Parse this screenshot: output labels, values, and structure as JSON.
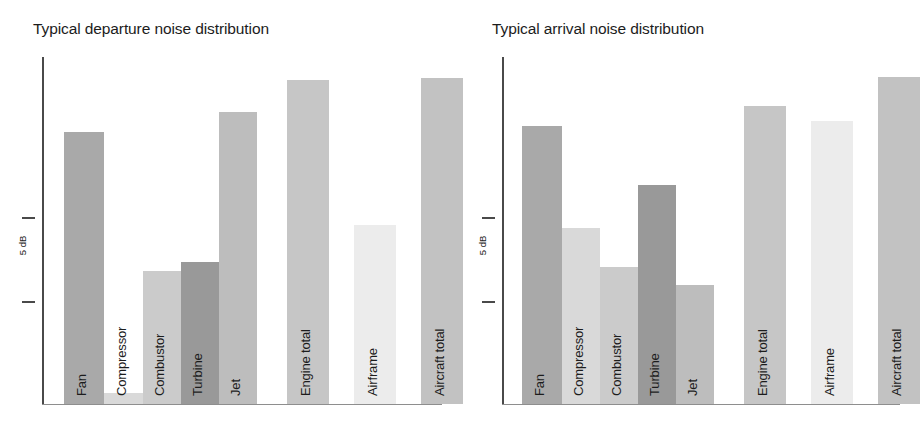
{
  "figure": {
    "background": "#ffffff",
    "width": 916,
    "height": 429
  },
  "scale_reference": {
    "label": "5 dB",
    "span_db": 5,
    "orientation": "vertical"
  },
  "palette": {
    "fan": "#a9a9a9",
    "compressor": "#d9d9d9",
    "combustor": "#cbcbcb",
    "turbine": "#999999",
    "jet": "#bdbdbd",
    "engine_total": "#c6c6c6",
    "airframe": "#ececec",
    "aircraft_total": "#c2c2c2",
    "axis": "#4a4a4a",
    "text": "#1c1c1c"
  },
  "chart_data": [
    {
      "id": "departure",
      "type": "bar",
      "title": "Typical departure noise distribution",
      "xlabel": "",
      "ylabel": "5 dB",
      "ylim": [
        0,
        40
      ],
      "grid": false,
      "legend": "none",
      "axis_note": "Relative sound pressure level; only a 5 dB reference bracket is marked, no numeric ticks.",
      "categories": [
        "Fan",
        "Compressor",
        "Combustor",
        "Turbine",
        "Jet",
        "Engine total",
        "Airframe",
        "Aircraft total"
      ],
      "values": [
        31.3,
        1.3,
        15.3,
        16.4,
        33.7,
        37.3,
        20.6,
        37.6
      ],
      "colors": [
        "#a9a9a9",
        "#d9d9d9",
        "#cbcbcb",
        "#999999",
        "#bdbdbd",
        "#c6c6c6",
        "#ececec",
        "#c2c2c2"
      ],
      "bars": [
        {
          "label": "Fan",
          "value": 31.3,
          "color": "#a9a9a9",
          "x": 20,
          "width": 40
        },
        {
          "label": "Compressor",
          "value": 1.3,
          "color": "#d9d9d9",
          "x": 60,
          "width": 39
        },
        {
          "label": "Combustor",
          "value": 15.3,
          "color": "#cbcbcb",
          "x": 99,
          "width": 38
        },
        {
          "label": "Turbine",
          "value": 16.4,
          "color": "#999999",
          "x": 137,
          "width": 38
        },
        {
          "label": "Jet",
          "value": 33.7,
          "color": "#bdbdbd",
          "x": 175,
          "width": 38
        },
        {
          "label": "Engine total",
          "value": 37.3,
          "color": "#c6c6c6",
          "x": 243,
          "width": 42
        },
        {
          "label": "Airframe",
          "value": 20.6,
          "color": "#ececec",
          "x": 310,
          "width": 42
        },
        {
          "label": "Aircraft total",
          "value": 37.6,
          "color": "#c2c2c2",
          "x": 377,
          "width": 42
        }
      ]
    },
    {
      "id": "arrival",
      "type": "bar",
      "title": "Typical arrival noise distribution",
      "xlabel": "",
      "ylabel": "5 dB",
      "ylim": [
        0,
        40
      ],
      "grid": false,
      "legend": "none",
      "axis_note": "Relative sound pressure level; only a 5 dB reference bracket is marked, no numeric ticks.",
      "categories": [
        "Fan",
        "Compressor",
        "Combustor",
        "Turbine",
        "Jet",
        "Engine total",
        "Airframe",
        "Aircraft total"
      ],
      "values": [
        32.0,
        20.3,
        15.8,
        25.2,
        13.7,
        34.3,
        32.6,
        37.7
      ],
      "colors": [
        "#a9a9a9",
        "#d9d9d9",
        "#cbcbcb",
        "#999999",
        "#bdbdbd",
        "#c6c6c6",
        "#ececec",
        "#c2c2c2"
      ],
      "bars": [
        {
          "label": "Fan",
          "value": 32.0,
          "color": "#a9a9a9",
          "x": 18,
          "width": 40
        },
        {
          "label": "Compressor",
          "value": 20.3,
          "color": "#d9d9d9",
          "x": 58,
          "width": 38
        },
        {
          "label": "Combustor",
          "value": 15.8,
          "color": "#cbcbcb",
          "x": 96,
          "width": 38
        },
        {
          "label": "Turbine",
          "value": 25.2,
          "color": "#999999",
          "x": 134,
          "width": 38
        },
        {
          "label": "Jet",
          "value": 13.7,
          "color": "#bdbdbd",
          "x": 172,
          "width": 38
        },
        {
          "label": "Engine total",
          "value": 34.3,
          "color": "#c6c6c6",
          "x": 240,
          "width": 42
        },
        {
          "label": "Airframe",
          "value": 32.6,
          "color": "#ececec",
          "x": 307,
          "width": 42
        },
        {
          "label": "Aircraft total",
          "value": 37.7,
          "color": "#c2c2c2",
          "x": 374,
          "width": 42
        }
      ]
    }
  ]
}
